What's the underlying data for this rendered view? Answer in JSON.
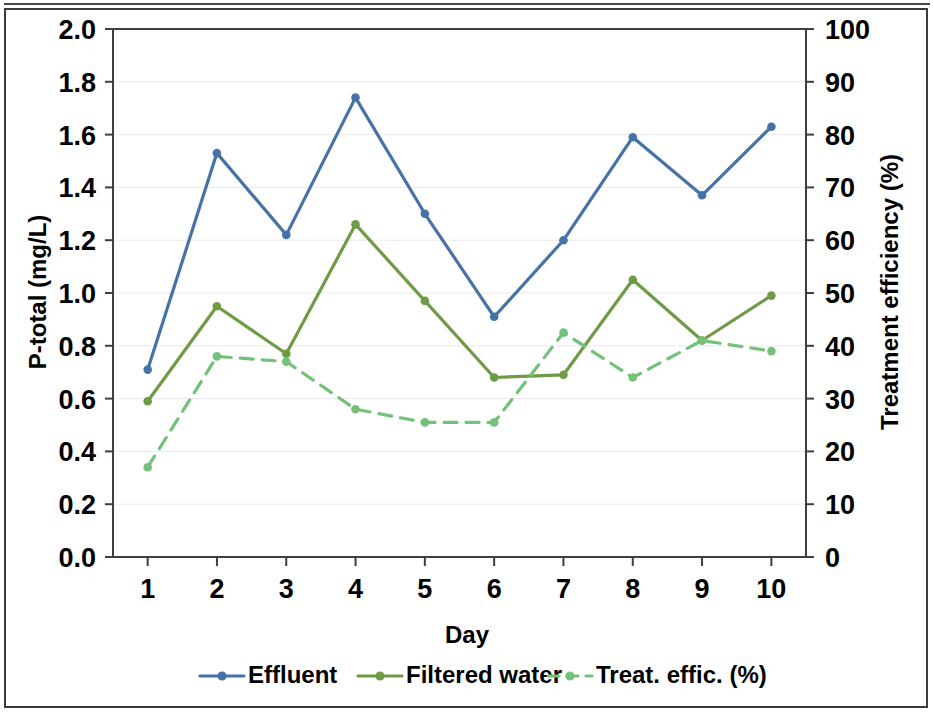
{
  "chart_data": {
    "type": "line",
    "title": "",
    "xlabel": "Day",
    "ylabel": "P-total (mg/L)",
    "y2label": "Treatment efficiency (%)",
    "categories": [
      "1",
      "2",
      "3",
      "4",
      "5",
      "6",
      "7",
      "8",
      "9",
      "10"
    ],
    "x": [
      1,
      2,
      3,
      4,
      5,
      6,
      7,
      8,
      9,
      10
    ],
    "ylim": [
      0.0,
      2.0
    ],
    "y2lim": [
      0,
      100
    ],
    "yticks": [
      "0.0",
      "0.2",
      "0.4",
      "0.6",
      "0.8",
      "1.0",
      "1.2",
      "1.4",
      "1.6",
      "1.8",
      "2.0"
    ],
    "ytick_values": [
      0.0,
      0.2,
      0.4,
      0.6,
      0.8,
      1.0,
      1.2,
      1.4,
      1.6,
      1.8,
      2.0
    ],
    "y2ticks": [
      "0",
      "10",
      "20",
      "30",
      "40",
      "50",
      "60",
      "70",
      "80",
      "90",
      "100"
    ],
    "y2tick_values": [
      0,
      10,
      20,
      30,
      40,
      50,
      60,
      70,
      80,
      90,
      100
    ],
    "grid": true,
    "grid_axis": "y",
    "legend_position": "bottom",
    "series": [
      {
        "name": "Effluent",
        "axis": "left",
        "color": "#4573a8",
        "style": "solid",
        "marker": "circle",
        "values": [
          0.71,
          1.53,
          1.22,
          1.74,
          1.3,
          0.91,
          1.2,
          1.59,
          1.37,
          1.63
        ]
      },
      {
        "name": "Filtered water",
        "axis": "left",
        "color": "#6f9b46",
        "style": "solid",
        "marker": "circle",
        "values": [
          0.59,
          0.95,
          0.77,
          1.26,
          0.97,
          0.68,
          0.69,
          1.05,
          0.82,
          0.99
        ]
      },
      {
        "name": "Treat. effic. (%)",
        "axis": "right",
        "color": "#74c27a",
        "style": "dashed",
        "marker": "circle",
        "values": [
          17,
          38,
          37,
          28,
          25.5,
          25.5,
          42.5,
          34,
          41,
          39
        ]
      }
    ]
  },
  "legend": {
    "items": [
      {
        "label": "Effluent",
        "color": "#4573a8",
        "style": "solid"
      },
      {
        "label": "Filtered water",
        "color": "#6f9b46",
        "style": "solid"
      },
      {
        "label": "Treat. effic. (%)",
        "color": "#74c27a",
        "style": "dashed"
      }
    ]
  }
}
